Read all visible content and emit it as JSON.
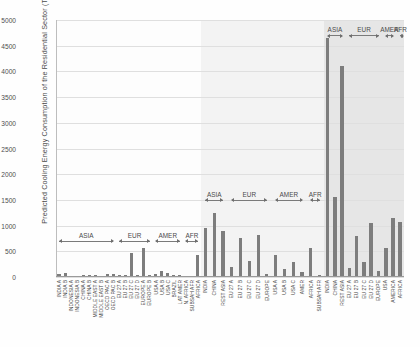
{
  "chart_data": {
    "type": "bar",
    "title": "",
    "xlabel": "",
    "ylabel": "Predicted Cooling Energy Consumption of the Residential Sector (TWh)",
    "ylim": [
      0,
      5000
    ],
    "yticks": [
      0,
      500,
      1000,
      1500,
      2000,
      2500,
      3000,
      3500,
      4000,
      4500,
      5000
    ],
    "grid": true,
    "legend": "none",
    "bar_color": "#7d7d7d",
    "panels": [
      {
        "name": "panel-left",
        "background": "#fdfdfd",
        "bracket_baseline": 700,
        "brackets": [
          {
            "label": "ASIA",
            "start_index": 0,
            "end_index": 9
          },
          {
            "label": "EUR",
            "start_index": 10,
            "end_index": 15
          },
          {
            "label": "AMER",
            "start_index": 16,
            "end_index": 20
          },
          {
            "label": "AFR",
            "start_index": 21,
            "end_index": 23
          }
        ],
        "categories": [
          "INDIA A",
          "INDIA B",
          "INDONESIA A",
          "INDONESIA B",
          "CHINA A",
          "CHINA B",
          "MIDDLE EAST A",
          "MIDDLE EAST B",
          "OECD PAC A",
          "OECD PAC B",
          "EU 27 A",
          "EU 27 B",
          "EU 27 C",
          "EU 27 D",
          "EUROPE A",
          "EUROPE B",
          "USA A",
          "USA B",
          "USA C",
          "BRAZIL",
          "LAT AMER",
          "N. AFRICA",
          "SUBSAH AFR",
          "AFRICA"
        ],
        "values": [
          60,
          85,
          25,
          20,
          45,
          40,
          30,
          25,
          55,
          50,
          30,
          40,
          470,
          35,
          560,
          45,
          60,
          120,
          70,
          35,
          30,
          20,
          25,
          430
        ]
      },
      {
        "name": "panel-middle",
        "background": "#f3f3f3",
        "bracket_baseline": 1500,
        "brackets": [
          {
            "label": "ASIA",
            "start_index": 0,
            "end_index": 2
          },
          {
            "label": "EUR",
            "start_index": 3,
            "end_index": 7
          },
          {
            "label": "AMER",
            "start_index": 8,
            "end_index": 11
          },
          {
            "label": "AFR",
            "start_index": 12,
            "end_index": 13
          }
        ],
        "categories": [
          "INDIA",
          "CHINA",
          "REST ASIA",
          "EU 27 A",
          "EU 27 B",
          "EU 27 C",
          "EU 27 D",
          "EUROPE",
          "USA A",
          "USA B",
          "USA C",
          "AMER",
          "AFRICA",
          "SUBSAH AFR"
        ],
        "values": [
          960,
          1250,
          900,
          190,
          760,
          310,
          820,
          60,
          430,
          160,
          290,
          90,
          560,
          40
        ]
      },
      {
        "name": "panel-right",
        "background": "#e6e6e6",
        "bracket_baseline": 4700,
        "brackets": [
          {
            "label": "ASIA",
            "start_index": 0,
            "end_index": 2
          },
          {
            "label": "EUR",
            "start_index": 3,
            "end_index": 7
          },
          {
            "label": "AMER",
            "start_index": 8,
            "end_index": 9
          },
          {
            "label": "AFR",
            "start_index": 10,
            "end_index": 10
          }
        ],
        "categories": [
          "INDIA",
          "CHINA",
          "REST ASIA",
          "EU 27 A",
          "EU 27 B",
          "EU 27 C",
          "EU 27 D",
          "EUROPE",
          "USA",
          "AMERICA",
          "AFRICA"
        ],
        "values": [
          4650,
          1550,
          4100,
          180,
          800,
          290,
          1050,
          120,
          560,
          1150,
          1080
        ]
      }
    ]
  }
}
